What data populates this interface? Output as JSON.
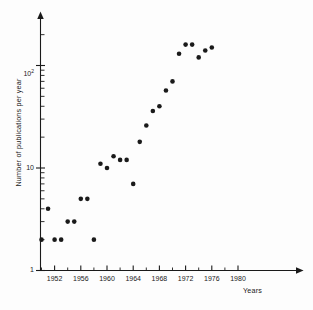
{
  "figure": {
    "background_color": "#fdfdfd",
    "ink_color": "#1a1a1a",
    "marker_color": "#1a1a1a"
  },
  "axes": {
    "y_title": "Number of publications per year",
    "x_title": "Years",
    "y_tick_labels": [
      {
        "text": "1",
        "value": 1,
        "y_px": 270
      },
      {
        "text": "10",
        "value": 10,
        "y_px": 168
      },
      {
        "text": "10",
        "sup": "2",
        "value": 100,
        "y_px": 72
      }
    ],
    "x_tick_labels": [
      {
        "text": "1952",
        "value": 1952
      },
      {
        "text": "1956",
        "value": 1956
      },
      {
        "text": "1960",
        "value": 1960
      },
      {
        "text": "1964",
        "value": 1964
      },
      {
        "text": "1968",
        "value": 1968
      },
      {
        "text": "1972",
        "value": 1972
      },
      {
        "text": "1976",
        "value": 1976
      },
      {
        "text": "1980",
        "value": 1980
      }
    ]
  },
  "chart_data": {
    "type": "scatter",
    "title": "",
    "subtitle": "",
    "xlabel": "Years",
    "ylabel": "Number of publications per year",
    "yscale": "log",
    "xscale": "linear",
    "xlim": [
      1949,
      1982
    ],
    "ylim": [
      1,
      300
    ],
    "grid": false,
    "legend": null,
    "marker": "filled-circle",
    "marker_color": "#1a1a1a",
    "marker_size_px": 3.4,
    "x_major_ticks": [
      1952,
      1956,
      1960,
      1964,
      1968,
      1972,
      1976,
      1980
    ],
    "x_minor_ticks": [
      1950,
      1954,
      1958,
      1962,
      1966,
      1970,
      1974,
      1978
    ],
    "y_major_ticks": [
      1,
      10,
      100
    ],
    "y_minor_ticks": [
      2,
      3,
      4,
      5,
      6,
      7,
      8,
      9,
      20,
      30,
      40,
      50,
      60,
      70,
      80,
      90,
      200
    ],
    "x": [
      1950,
      1951,
      1952,
      1953,
      1954,
      1955,
      1956,
      1957,
      1958,
      1959,
      1960,
      1961,
      1962,
      1963,
      1964,
      1965,
      1966,
      1967,
      1968,
      1969,
      1970,
      1971,
      1972,
      1973,
      1974,
      1975,
      1976
    ],
    "y": [
      2,
      4,
      2,
      2,
      3,
      3,
      5,
      5,
      2,
      11,
      10,
      13,
      12,
      12,
      7,
      18,
      26,
      36,
      40,
      57,
      70,
      130,
      160,
      160,
      120,
      140,
      150
    ],
    "points": [
      {
        "year": 1950,
        "publications": 2
      },
      {
        "year": 1951,
        "publications": 4
      },
      {
        "year": 1952,
        "publications": 2
      },
      {
        "year": 1953,
        "publications": 2
      },
      {
        "year": 1954,
        "publications": 3
      },
      {
        "year": 1955,
        "publications": 3
      },
      {
        "year": 1956,
        "publications": 5
      },
      {
        "year": 1957,
        "publications": 5
      },
      {
        "year": 1958,
        "publications": 2
      },
      {
        "year": 1959,
        "publications": 11
      },
      {
        "year": 1960,
        "publications": 10
      },
      {
        "year": 1961,
        "publications": 13
      },
      {
        "year": 1962,
        "publications": 12
      },
      {
        "year": 1963,
        "publications": 12
      },
      {
        "year": 1964,
        "publications": 7
      },
      {
        "year": 1965,
        "publications": 18
      },
      {
        "year": 1966,
        "publications": 26
      },
      {
        "year": 1967,
        "publications": 36
      },
      {
        "year": 1968,
        "publications": 40
      },
      {
        "year": 1969,
        "publications": 57
      },
      {
        "year": 1970,
        "publications": 70
      },
      {
        "year": 1971,
        "publications": 130
      },
      {
        "year": 1972,
        "publications": 160
      },
      {
        "year": 1973,
        "publications": 160
      },
      {
        "year": 1974,
        "publications": 120
      },
      {
        "year": 1975,
        "publications": 140
      },
      {
        "year": 1976,
        "publications": 150
      }
    ]
  }
}
